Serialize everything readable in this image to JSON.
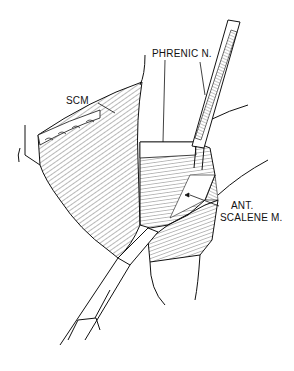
{
  "figure": {
    "labels": {
      "phrenic": "PHRENIC N.",
      "scm": "SCM",
      "ant": "ANT.",
      "scalene": "SCALENE M."
    },
    "colors": {
      "ink": "#111111",
      "background": "#ffffff"
    }
  }
}
